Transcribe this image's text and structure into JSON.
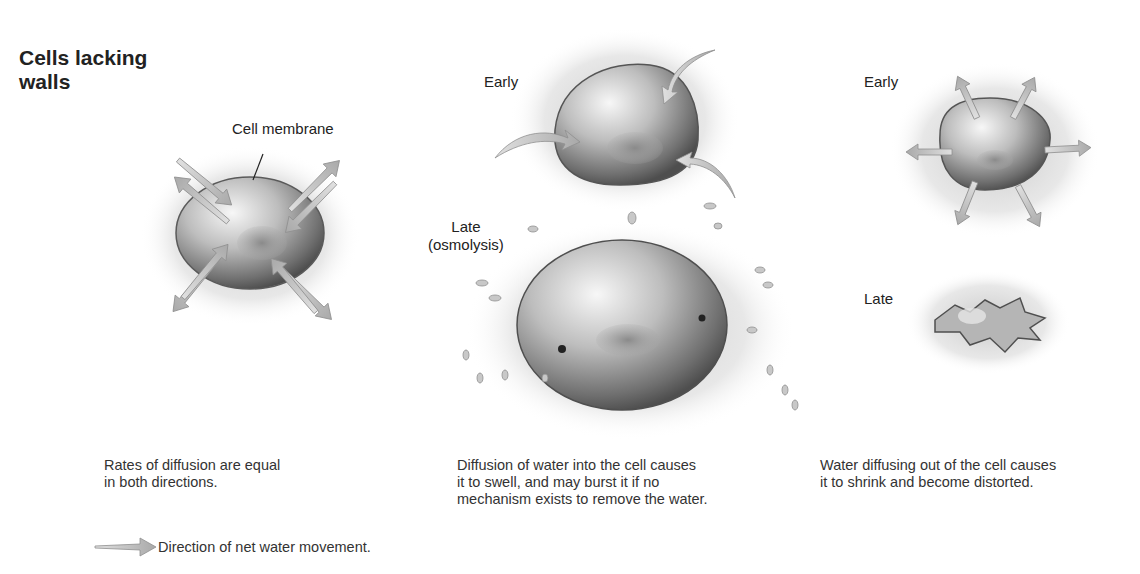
{
  "title": "Cells lacking walls",
  "title_lines": [
    "Cells lacking",
    "walls"
  ],
  "panels": [
    {
      "id": "isotonic",
      "labels": {
        "membrane": "Cell membrane"
      },
      "caption_lines": [
        "Rates of diffusion are equal",
        "in both directions."
      ]
    },
    {
      "id": "hypotonic",
      "labels": {
        "early": "Early",
        "late_line1": "Late",
        "late_line2": "(osmolysis)"
      },
      "caption_lines": [
        "Diffusion of water into the cell causes",
        "it to swell, and may burst it if no",
        "mechanism exists to remove the water."
      ]
    },
    {
      "id": "hypertonic",
      "labels": {
        "early": "Early",
        "late": "Late"
      },
      "caption_lines": [
        "Water diffusing out of the cell causes",
        "it to shrink and become distorted."
      ]
    }
  ],
  "legend": {
    "icon": "arrow-right-icon",
    "text": "Direction of net water movement."
  },
  "colors": {
    "arrow": "#bdbdbd",
    "cell_dark": "#555555",
    "cell_light": "#f2f2f2",
    "text": "#222222"
  }
}
